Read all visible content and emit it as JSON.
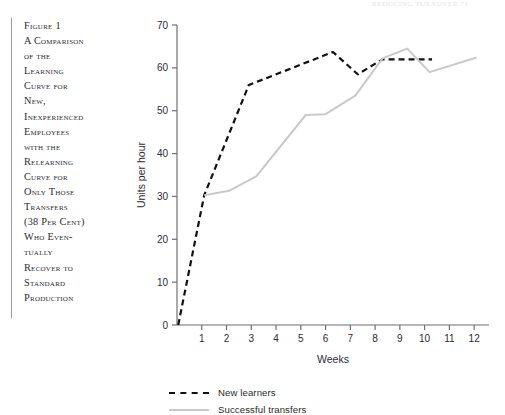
{
  "page_header_remnant": "REDUCING TURNOVER  71",
  "caption": {
    "text": "Figure 1\nA Comparison\nof the\nLearning\nCurve for\nNew,\nInexperienced\nEmployees\nwith the\nRelearning\nCurve for\nOnly Those\nTransfers\n(38 Per Cent)\nWho Even-\ntually\nRecover to\nStandard\nProduction"
  },
  "chart_data": {
    "type": "line",
    "title": "",
    "xlabel": "Weeks",
    "ylabel": "Units per hour",
    "xlim": [
      0,
      12.6
    ],
    "ylim": [
      0,
      70
    ],
    "xticks": [
      1,
      2,
      3,
      4,
      5,
      6,
      7,
      8,
      9,
      10,
      11,
      12
    ],
    "xticklabels": [
      "1",
      "2",
      "3",
      "4",
      "5",
      "6",
      "7",
      "8",
      "9",
      "10",
      "11",
      "12"
    ],
    "yticks": [
      0,
      10,
      20,
      30,
      40,
      50,
      60,
      70
    ],
    "yticklabels": [
      "0",
      "10",
      "20",
      "30",
      "40",
      "50",
      "60",
      "70"
    ],
    "grid": false,
    "legend_position": "bottom-left",
    "series": [
      {
        "name": "New learners",
        "style": "dashed",
        "color": "#111111",
        "x": [
          0.05,
          1.1,
          2.9,
          6.3,
          7.3,
          8.3,
          10.3
        ],
        "y": [
          0,
          30.3,
          56.0,
          63.7,
          58.5,
          62.0,
          62.0
        ]
      },
      {
        "name": "Successful transfers",
        "style": "solid",
        "color": "#c9c9c9",
        "x": [
          1.1,
          2.1,
          3.2,
          5.2,
          6.0,
          7.2,
          8.3,
          9.3,
          10.2,
          12.1
        ],
        "y": [
          30.3,
          31.3,
          34.7,
          49.0,
          49.2,
          53.5,
          62.2,
          64.5,
          59.0,
          62.4
        ]
      }
    ]
  },
  "legend": {
    "items": [
      {
        "label": "New learners",
        "style": "dashed"
      },
      {
        "label": "Successful transfers",
        "style": "solid"
      }
    ]
  },
  "colors": {
    "new_learners": "#111111",
    "successful_transfers": "#c9c9c9",
    "axis": "#6f6f77",
    "text": "#2b2b33"
  }
}
